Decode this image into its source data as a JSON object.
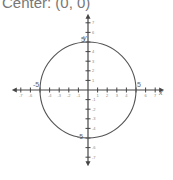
{
  "title": "Center: (0, 0)",
  "chart_data": {
    "type": "line",
    "title": "Center: (0, 0)",
    "subtype": "circle",
    "circle": {
      "center": [
        0,
        0
      ],
      "radius": 5
    },
    "xlabel": "x",
    "ylabel": "y",
    "xlim": [
      -7,
      7
    ],
    "ylim": [
      -7,
      7
    ],
    "x_ticks": [
      -7,
      -6,
      -5,
      -4,
      -3,
      -2,
      -1,
      1,
      2,
      3,
      4,
      5,
      6,
      7
    ],
    "y_ticks": [
      -7,
      -6,
      -5,
      -4,
      -3,
      -2,
      -1,
      1,
      2,
      3,
      4,
      5,
      6,
      7
    ],
    "annotations": [
      "5",
      "-5",
      "5",
      "-5"
    ],
    "grid": false,
    "legend": null
  },
  "labels": {
    "x_axis": "x",
    "y_axis": "y",
    "x_pos5": "5",
    "x_neg5": "-5",
    "y_pos5": "5",
    "y_neg5": "-5"
  }
}
